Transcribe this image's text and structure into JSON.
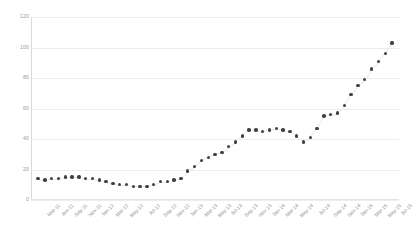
{
  "chart_data": {
    "type": "scatter",
    "title": "",
    "subtitle": "",
    "xlabel": "",
    "ylabel": "",
    "grid": true,
    "legend": null,
    "ylim": [
      0,
      120
    ],
    "yticks": [
      0,
      20,
      40,
      60,
      80,
      100,
      120
    ],
    "ytick_labels": [
      "0",
      "20",
      "40",
      "60",
      "80",
      "100",
      "120"
    ],
    "marker_color": "#3f3f46",
    "gridline_color": "#ededed",
    "x": [
      "Mar-11",
      "Apr-11",
      "May-11",
      "Jun-11",
      "Jul-11",
      "Aug-11",
      "Sep-11",
      "Oct-11",
      "Nov-11",
      "Dec-11",
      "Jan-12",
      "Feb-12",
      "Mar-12",
      "Apr-12",
      "May-12",
      "Jun-12",
      "Jul-12",
      "Aug-12",
      "Sep-12",
      "Oct-12",
      "Nov-12",
      "Dec-12",
      "Jan-13",
      "Feb-13",
      "Mar-13",
      "Apr-13",
      "May-13",
      "Jun-13",
      "Jul-13",
      "Aug-13",
      "Sep-13",
      "Oct-13",
      "Nov-13",
      "Dec-13",
      "Jan-14",
      "Feb-14",
      "Mar-14",
      "Apr-14",
      "May-14",
      "Jun-14",
      "Jul-14",
      "Aug-14",
      "Sep-14",
      "Oct-14",
      "Nov-14",
      "Dec-14",
      "Jan-15",
      "Feb-15",
      "Mar-15",
      "Apr-15",
      "May-15",
      "Jun-15",
      "Jul-15"
    ],
    "xtick_labels": [
      "Mar-11",
      "Jun-11",
      "Sep-11",
      "Nov-11",
      "Jan-12",
      "Mar-12",
      "May-12",
      "Jul-12",
      "Sep-12",
      "Nov-12",
      "Jan-13",
      "Mar-13",
      "May-13",
      "Jul-13",
      "Sep-13",
      "Nov-13",
      "Jan-14",
      "Mar-14",
      "May-14",
      "Jul-14",
      "Sep-14",
      "Nov-14",
      "Jan-15",
      "Mar-15",
      "May-15",
      "Jul-15"
    ],
    "values": [
      14,
      13,
      14,
      14,
      15,
      15,
      15,
      14,
      14,
      13,
      12,
      11,
      10,
      10,
      9,
      9,
      9,
      10,
      12,
      12,
      13,
      14,
      19,
      22,
      26,
      28,
      30,
      31,
      35,
      38,
      42,
      46,
      46,
      45,
      46,
      47,
      46,
      45,
      42,
      38,
      41,
      47,
      55,
      56,
      57,
      62,
      69,
      75,
      79,
      86,
      91,
      96,
      103
    ]
  }
}
